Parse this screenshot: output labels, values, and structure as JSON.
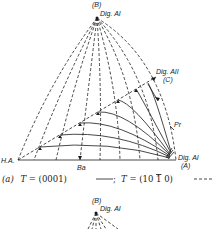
{
  "figure_a": {
    "labels": {
      "apex_point": "(B)",
      "apex_name": "Dig. AI",
      "left_corner": "H.A.",
      "right_corner_name": "Dig. AI",
      "right_corner_point": "(A)",
      "upper_right_name": "Dig. AII",
      "upper_right_point": "(C)",
      "side_point": "Pr",
      "bottom_point": "Ba"
    },
    "caption": {
      "prefix": "(a)",
      "t1_var": "T",
      "t1_eq": " = (0001) ",
      "sep": ";",
      "t2_var": "T",
      "t2_eq": " = (10",
      "t2_bar": "1",
      "t2_end": "0) "
    },
    "legend": [
      {
        "series": "T = (0001)",
        "style": "solid"
      },
      {
        "series": "T = (10-10)",
        "style": "dashed"
      }
    ]
  },
  "figure_b": {
    "labels": {
      "apex_point": "(B)",
      "apex_name": "Dig. AI"
    }
  }
}
